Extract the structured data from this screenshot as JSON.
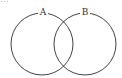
{
  "header": {
    "cropped_text": "…"
  },
  "diagram": {
    "type": "venn",
    "sets": [
      {
        "label": "A",
        "cx": 42,
        "cy": 44,
        "r": 31
      },
      {
        "label": "B",
        "cx": 85,
        "cy": 44,
        "r": 31
      }
    ],
    "stroke": "#444444"
  }
}
